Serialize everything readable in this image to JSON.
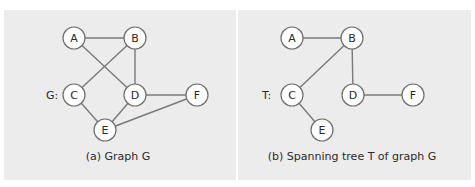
{
  "figure": {
    "panels": [
      {
        "id": "a",
        "graph_label": "G:",
        "caption": "(a) Graph G",
        "nodes": [
          {
            "id": "A",
            "x": 74,
            "y": 38
          },
          {
            "id": "B",
            "x": 135,
            "y": 38
          },
          {
            "id": "C",
            "x": 74,
            "y": 95
          },
          {
            "id": "D",
            "x": 135,
            "y": 95
          },
          {
            "id": "F",
            "x": 197,
            "y": 95
          },
          {
            "id": "E",
            "x": 105,
            "y": 130
          }
        ],
        "edges": [
          [
            "A",
            "B"
          ],
          [
            "A",
            "D"
          ],
          [
            "B",
            "C"
          ],
          [
            "B",
            "D"
          ],
          [
            "C",
            "E"
          ],
          [
            "D",
            "E"
          ],
          [
            "D",
            "F"
          ],
          [
            "E",
            "F"
          ]
        ]
      },
      {
        "id": "b",
        "graph_label": "T:",
        "caption": "(b) Spanning tree T of graph G",
        "nodes": [
          {
            "id": "A",
            "x": 292,
            "y": 38
          },
          {
            "id": "B",
            "x": 352,
            "y": 38
          },
          {
            "id": "C",
            "x": 292,
            "y": 95
          },
          {
            "id": "D",
            "x": 353,
            "y": 95
          },
          {
            "id": "F",
            "x": 413,
            "y": 95
          },
          {
            "id": "E",
            "x": 322,
            "y": 130
          }
        ],
        "edges": [
          [
            "A",
            "B"
          ],
          [
            "B",
            "C"
          ],
          [
            "B",
            "D"
          ],
          [
            "C",
            "E"
          ],
          [
            "D",
            "F"
          ]
        ]
      }
    ],
    "colors": {
      "panel_bg": "#ececec",
      "edge": "#7a7a7a",
      "node_fill": "#ffffff",
      "node_stroke": "#6e6e6e",
      "text": "#2a2a2a"
    }
  }
}
